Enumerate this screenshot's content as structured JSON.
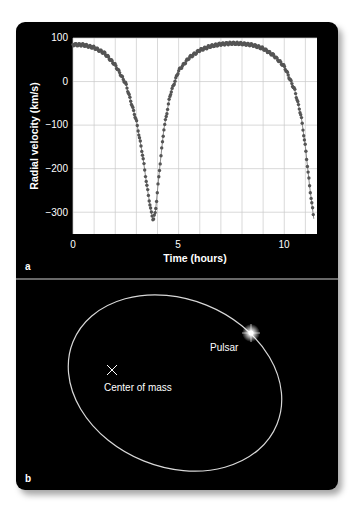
{
  "panel_a": {
    "label": "a",
    "xlabel": "Time (hours)",
    "ylabel": "Radial velocity (km/s)",
    "x_ticks": [
      "0",
      "5",
      "10"
    ],
    "y_ticks": [
      "100",
      "0",
      "−100",
      "−200",
      "−300"
    ]
  },
  "panel_b": {
    "label": "b",
    "center_label": "Center of mass",
    "pulsar_label": "Pulsar",
    "center_marker": "×"
  },
  "colors": {
    "background": "#000000",
    "plot_bg": "#ffffff",
    "grid": "#c8c8c8",
    "data": "#555555",
    "orbit": "#d8d8d8",
    "text": "#ffffff"
  },
  "chart_data": [
    {
      "type": "scatter",
      "title": "",
      "xlabel": "Time (hours)",
      "ylabel": "Radial velocity (km/s)",
      "xlim": [
        0,
        11.55
      ],
      "ylim": [
        -350,
        100
      ],
      "x_ticks": [
        0,
        5,
        10
      ],
      "y_ticks": [
        100,
        0,
        -100,
        -200,
        -300
      ],
      "grid": true,
      "grid_x_step": 1,
      "grid_y_step": 100,
      "legend": null,
      "series": [
        {
          "name": "Radial velocity",
          "x": [
            0.0,
            0.5,
            1.0,
            1.5,
            2.0,
            2.5,
            3.0,
            3.3,
            3.5,
            3.7,
            3.8,
            3.9,
            4.1,
            4.3,
            4.6,
            5.0,
            5.5,
            6.0,
            6.5,
            7.0,
            7.5,
            8.0,
            8.5,
            9.0,
            9.5,
            10.0,
            10.5,
            10.8,
            11.0,
            11.2,
            11.4
          ],
          "y": [
            85,
            84,
            78,
            65,
            38,
            -5,
            -90,
            -170,
            -240,
            -300,
            -318,
            -300,
            -200,
            -110,
            -30,
            25,
            55,
            72,
            81,
            86,
            88,
            87,
            84,
            76,
            60,
            35,
            -20,
            -80,
            -150,
            -240,
            -315
          ]
        }
      ],
      "period_hours": 7.75,
      "min_velocity": -320,
      "max_velocity": 88
    },
    {
      "type": "diagram",
      "title": "Pulsar orbit",
      "annotations": [
        "Center of mass",
        "Pulsar"
      ],
      "orbit_shape": "ellipse"
    }
  ]
}
